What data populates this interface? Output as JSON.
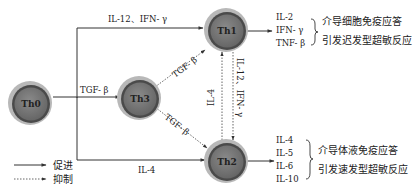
{
  "cells": {
    "th0": {
      "label": "Th0"
    },
    "th1": {
      "label": "Th1"
    },
    "th2": {
      "label": "Th2"
    },
    "th3": {
      "label": "Th3"
    }
  },
  "edges": {
    "th0_th1": {
      "label": "IL-12、IFN- γ",
      "style": "promote"
    },
    "th0_th3": {
      "label": "TGF- β",
      "style": "promote"
    },
    "th0_th2": {
      "label": "IL-4",
      "style": "promote"
    },
    "th3_th1": {
      "label": "TGF- β",
      "style": "inhibit"
    },
    "th3_th2": {
      "label": "TGF- β",
      "style": "inhibit"
    },
    "th2_th1": {
      "label": "IL-4",
      "style": "inhibit"
    },
    "th1_th2": {
      "label": "IL-12、IFN- γ",
      "style": "inhibit"
    }
  },
  "outputs": {
    "th1": {
      "cytokines": [
        "IL-2",
        "IFN- γ",
        "TNF- β"
      ],
      "effects": [
        "介导细胞免疫应答",
        "引发迟发型超敏反应"
      ]
    },
    "th2": {
      "cytokines": [
        "IL-4",
        "IL-5",
        "IL-6",
        "IL-10"
      ],
      "effects": [
        "介导体液免疫应答",
        "引发速发型超敏反应"
      ]
    }
  },
  "legend": {
    "promote": "促进",
    "inhibit": "抑制"
  },
  "colors": {
    "cell_outer": "#b5b5b5",
    "cell_ring": "#5a5a5a",
    "cell_inner": "#7a7a7a",
    "line": "#333333"
  }
}
